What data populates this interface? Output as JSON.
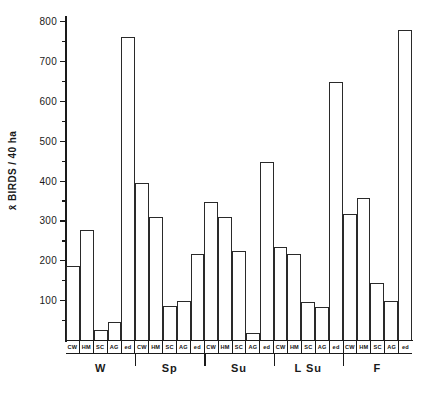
{
  "chart_data": {
    "type": "bar",
    "title": "",
    "xlabel": "",
    "ylabel": "x̄ BIRDS / 40 ha",
    "ylim": [
      0,
      800
    ],
    "ytick_major": [
      100,
      200,
      300,
      400,
      500,
      600,
      700,
      800
    ],
    "ytick_minor": [
      50,
      150,
      250,
      350,
      450,
      550,
      650,
      750
    ],
    "grid": false,
    "legend": "none",
    "groups": [
      "W",
      "Sp",
      "Su",
      "L Su",
      "F"
    ],
    "categories": [
      "CW",
      "HM",
      "SC",
      "AG",
      "ed"
    ],
    "series": [
      {
        "name": "W",
        "values": [
          185,
          275,
          25,
          45,
          760
        ]
      },
      {
        "name": "Sp",
        "values": [
          393,
          308,
          85,
          98,
          215
        ]
      },
      {
        "name": "Su",
        "values": [
          347,
          308,
          223,
          18,
          447
        ]
      },
      {
        "name": "L Su",
        "values": [
          233,
          215,
          95,
          82,
          648
        ]
      },
      {
        "name": "F",
        "values": [
          315,
          357,
          143,
          97,
          778
        ]
      }
    ],
    "bar_labels_flat": [
      "CW",
      "HM",
      "SC",
      "AG",
      "ed",
      "CW",
      "HM",
      "SC",
      "AG",
      "ed",
      "CW",
      "HM",
      "SC",
      "AG",
      "ed",
      "CW",
      "HM",
      "SC",
      "AG",
      "ed",
      "CW",
      "HM",
      "SC",
      "AG",
      "ed"
    ],
    "colors": {
      "bar_fill": "#ffffff",
      "bar_stroke": "#2a2a2a",
      "axis": "#1a1a1a",
      "background": "#ffffff"
    }
  }
}
